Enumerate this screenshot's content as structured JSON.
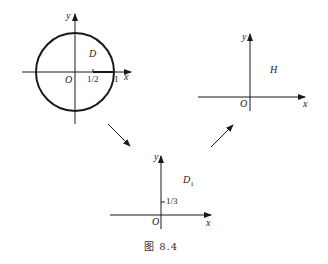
{
  "figure": {
    "caption": "图   8.4",
    "panels": {
      "disk": {
        "region_label": "D",
        "x_axis": "x",
        "y_axis": "y",
        "origin": "O",
        "tick_half": "1/2",
        "tick_one": "1"
      },
      "half_plane": {
        "region_label": "H",
        "x_axis": "x",
        "y_axis": "y",
        "origin": "O"
      },
      "quarter_plane": {
        "region_label": "D",
        "region_subscript": "1",
        "x_axis": "x",
        "y_axis": "y",
        "origin": "O",
        "tick_third": "1/3"
      }
    },
    "colors": {
      "stroke": "#1a1a1a",
      "background": "#ffffff"
    }
  }
}
